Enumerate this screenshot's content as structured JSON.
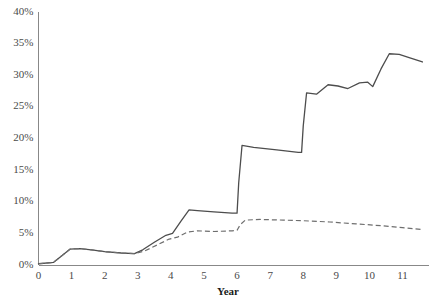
{
  "chart_data": {
    "type": "line",
    "title": "",
    "xlabel": "Year",
    "ylabel": "",
    "xlim": [
      0,
      11.8
    ],
    "ylim": [
      0,
      40
    ],
    "grid": false,
    "legend": "none",
    "xticks": [
      0,
      1,
      2,
      3,
      4,
      5,
      6,
      7,
      8,
      9,
      10,
      11
    ],
    "xtick_labels": [
      "0",
      "1",
      "2",
      "3",
      "4",
      "5",
      "6",
      "7",
      "8",
      "9",
      "10",
      "11"
    ],
    "yticks": [
      0,
      5,
      10,
      15,
      20,
      25,
      30,
      35,
      40
    ],
    "ytick_labels": [
      "0%",
      "5%",
      "10%",
      "15%",
      "20%",
      "25%",
      "30%",
      "35%",
      "40%"
    ],
    "series": [
      {
        "name": "solid-series",
        "style": "solid",
        "color": "#4d4d4d",
        "points": [
          [
            0.0,
            0.2
          ],
          [
            0.45,
            0.4
          ],
          [
            0.95,
            2.5
          ],
          [
            1.25,
            2.6
          ],
          [
            1.6,
            2.4
          ],
          [
            2.0,
            2.1
          ],
          [
            2.5,
            1.9
          ],
          [
            2.9,
            1.8
          ],
          [
            3.15,
            2.4
          ],
          [
            3.5,
            3.6
          ],
          [
            3.85,
            4.7
          ],
          [
            4.05,
            5.0
          ],
          [
            4.3,
            6.9
          ],
          [
            4.55,
            8.7
          ],
          [
            4.8,
            8.6
          ],
          [
            5.3,
            8.4
          ],
          [
            5.85,
            8.2
          ],
          [
            6.0,
            8.2
          ],
          [
            6.05,
            13.0
          ],
          [
            6.15,
            18.9
          ],
          [
            6.5,
            18.6
          ],
          [
            7.2,
            18.2
          ],
          [
            7.85,
            17.8
          ],
          [
            7.95,
            17.8
          ],
          [
            8.0,
            22.0
          ],
          [
            8.1,
            27.2
          ],
          [
            8.4,
            27.0
          ],
          [
            8.75,
            28.5
          ],
          [
            9.05,
            28.3
          ],
          [
            9.35,
            27.9
          ],
          [
            9.7,
            28.8
          ],
          [
            9.95,
            28.9
          ],
          [
            10.1,
            28.2
          ],
          [
            10.35,
            31.0
          ],
          [
            10.6,
            33.4
          ],
          [
            10.9,
            33.3
          ],
          [
            11.2,
            32.8
          ],
          [
            11.6,
            32.1
          ]
        ]
      },
      {
        "name": "dashed-series",
        "style": "dashed",
        "color": "#6e6e6e",
        "points": [
          [
            0.0,
            0.2
          ],
          [
            0.45,
            0.4
          ],
          [
            0.95,
            2.5
          ],
          [
            1.25,
            2.6
          ],
          [
            1.6,
            2.4
          ],
          [
            2.0,
            2.1
          ],
          [
            2.5,
            1.9
          ],
          [
            2.9,
            1.8
          ],
          [
            3.2,
            2.2
          ],
          [
            3.6,
            3.2
          ],
          [
            3.95,
            4.1
          ],
          [
            4.2,
            4.4
          ],
          [
            4.5,
            5.2
          ],
          [
            4.8,
            5.4
          ],
          [
            5.3,
            5.3
          ],
          [
            5.85,
            5.4
          ],
          [
            6.0,
            5.5
          ],
          [
            6.1,
            6.4
          ],
          [
            6.25,
            7.1
          ],
          [
            6.7,
            7.2
          ],
          [
            7.4,
            7.1
          ],
          [
            8.0,
            7.0
          ],
          [
            8.8,
            6.8
          ],
          [
            9.6,
            6.5
          ],
          [
            10.4,
            6.2
          ],
          [
            11.0,
            5.9
          ],
          [
            11.6,
            5.6
          ]
        ]
      }
    ]
  }
}
